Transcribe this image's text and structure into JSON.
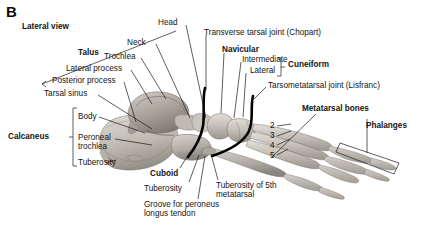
{
  "figure": {
    "panel_letter": "B",
    "view_label": "Lateral view",
    "colors": {
      "background": "#ffffff",
      "text": "#141414",
      "leader_line": "#1a1a1a",
      "joint_line": "#000000",
      "bone_light": "#d8d4cd",
      "bone_mid": "#b4afa7",
      "bone_dark": "#8d8880",
      "bone_shadow": "#6e6a63"
    }
  },
  "labels": {
    "panel": "B",
    "view": "Lateral view",
    "talus_group": "Talus",
    "head": "Head",
    "neck": "Neck",
    "trochlea": "Trochlea",
    "lateral_process": "Lateral process",
    "posterior_process": "Posterior process",
    "tarsal_sinus": "Tarsal sinus",
    "calcaneus_group": "Calcaneus",
    "body": "Body",
    "peroneal_trochlea": "Peroneal\ntrochlea",
    "tuberosity_calcaneus": "Tuberosity",
    "transverse_tarsal_joint": "Transverse tarsal joint  (Chopart)",
    "navicular": "Navicular",
    "intermediate": "Intermediate",
    "lateral": "Lateral",
    "cuneiform_group": "Cuneiform",
    "tarsometatarsal_joint": "Tarsometatarsal joint (Lisfranc)",
    "metatarsal_bones": "Metatarsal bones",
    "phalanges": "Phalanges",
    "cuboid": "Cuboid",
    "tuberosity_cuboid": "Tuberosity",
    "groove_peroneus": "Groove for peroneus\nlongus tendon",
    "tuberosity_5th": "Tuberosity of 5th\nmetatarsal"
  },
  "metatarsal_numbers": [
    "2",
    "3",
    "4",
    "5"
  ]
}
